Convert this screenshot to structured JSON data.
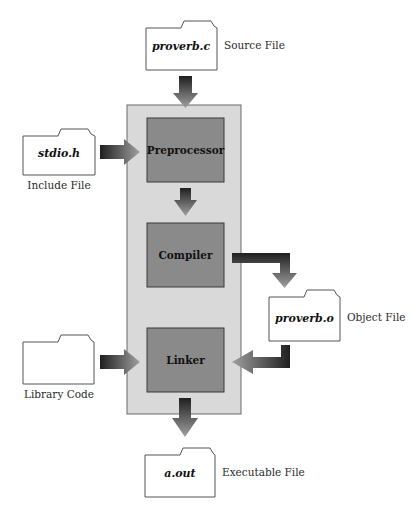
{
  "diagram": {
    "type": "flowchart",
    "colors": {
      "panel": "#d9d9d9",
      "stage_box": "#8a8a8a",
      "arrow_dark": "#2a2a2a",
      "arrow_light": "#9a9a9a",
      "folder_fill": "#ffffff",
      "folder_stroke": "#555555"
    },
    "stages": [
      {
        "id": "preprocessor",
        "label": "Preprocessor"
      },
      {
        "id": "compiler",
        "label": "Compiler"
      },
      {
        "id": "linker",
        "label": "Linker"
      }
    ],
    "files": {
      "source": {
        "name": "proverb.c",
        "caption": "Source File"
      },
      "include": {
        "name": "stdio.h",
        "caption": "Include File"
      },
      "object": {
        "name": "proverb.o",
        "caption": "Object File"
      },
      "library": {
        "name": "",
        "caption": "Library Code"
      },
      "executable": {
        "name": "a.out",
        "caption": "Executable File"
      }
    },
    "edges": [
      {
        "from": "source",
        "to": "preprocessor"
      },
      {
        "from": "include",
        "to": "preprocessor"
      },
      {
        "from": "preprocessor",
        "to": "compiler"
      },
      {
        "from": "compiler",
        "to": "object"
      },
      {
        "from": "object",
        "to": "linker"
      },
      {
        "from": "library",
        "to": "linker"
      },
      {
        "from": "linker",
        "to": "executable"
      }
    ]
  }
}
